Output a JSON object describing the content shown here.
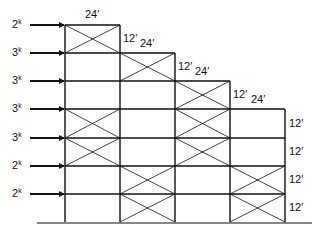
{
  "diagram": {
    "type": "braced-frame-elevation",
    "colors": {
      "line": "#111111",
      "background": "#ffffff"
    },
    "columns_x": [
      65,
      120,
      175,
      230,
      285
    ],
    "floors_y": [
      25,
      53,
      81,
      109,
      138,
      166,
      194,
      222
    ],
    "ground": {
      "y": 223,
      "x1": 37,
      "x2": 312
    },
    "stories": [
      {
        "top_y": 25,
        "bottom_y": 53,
        "bays": [
          0
        ],
        "braced_bays": [
          0
        ]
      },
      {
        "top_y": 53,
        "bottom_y": 81,
        "bays": [
          0,
          1
        ],
        "braced_bays": [
          1
        ]
      },
      {
        "top_y": 81,
        "bottom_y": 109,
        "bays": [
          0,
          1,
          2
        ],
        "braced_bays": [
          2
        ]
      },
      {
        "top_y": 109,
        "bottom_y": 138,
        "bays": [
          0,
          1,
          2,
          3
        ],
        "braced_bays": [
          0,
          2
        ]
      },
      {
        "top_y": 138,
        "bottom_y": 166,
        "bays": [
          0,
          1,
          2,
          3
        ],
        "braced_bays": [
          0,
          2
        ]
      },
      {
        "top_y": 166,
        "bottom_y": 194,
        "bays": [
          0,
          1,
          2,
          3
        ],
        "braced_bays": [
          1,
          3
        ]
      },
      {
        "top_y": 194,
        "bottom_y": 222,
        "bays": [
          0,
          1,
          2,
          3
        ],
        "braced_bays": [
          1,
          3
        ]
      }
    ],
    "loads": [
      {
        "value": "2",
        "unit": "k",
        "y": 25
      },
      {
        "value": "3",
        "unit": "k",
        "y": 53
      },
      {
        "value": "3",
        "unit": "k",
        "y": 81
      },
      {
        "value": "3",
        "unit": "k",
        "y": 109
      },
      {
        "value": "3",
        "unit": "k",
        "y": 138
      },
      {
        "value": "2",
        "unit": "k",
        "y": 166
      },
      {
        "value": "2",
        "unit": "k",
        "y": 194
      }
    ],
    "bay_width_labels": [
      {
        "text": "24′",
        "x": 85,
        "y": 9
      },
      {
        "text": "24′",
        "x": 140,
        "y": 38
      },
      {
        "text": "24′",
        "x": 195,
        "y": 66
      },
      {
        "text": "24′",
        "x": 251,
        "y": 94
      }
    ],
    "story_height_labels": [
      {
        "text": "12′",
        "x": 123,
        "y": 33
      },
      {
        "text": "12′",
        "x": 178,
        "y": 61
      },
      {
        "text": "12′",
        "x": 233,
        "y": 89
      },
      {
        "text": "12′",
        "x": 289,
        "y": 118
      },
      {
        "text": "12′",
        "x": 289,
        "y": 146
      },
      {
        "text": "12′",
        "x": 289,
        "y": 174
      },
      {
        "text": "12′",
        "x": 289,
        "y": 202
      }
    ]
  }
}
